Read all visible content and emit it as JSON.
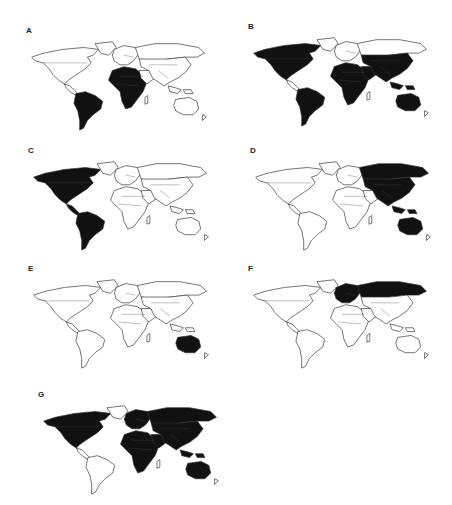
{
  "figure": {
    "type": "panel-of-world-maps",
    "panels": [
      {
        "label": "A",
        "shaded_regions": [
          "south_america_north",
          "central_africa"
        ]
      },
      {
        "label": "B",
        "shaded_regions": [
          "north_america_us_mexico",
          "south_america",
          "west_africa_patches",
          "east_africa_horn",
          "arabia",
          "south_asia_china",
          "southeast_asia",
          "australia"
        ]
      },
      {
        "label": "C",
        "shaded_regions": [
          "north_america",
          "central_america",
          "south_america"
        ]
      },
      {
        "label": "D",
        "shaded_regions": [
          "russia_asia",
          "china",
          "southeast_asia",
          "australia"
        ]
      },
      {
        "label": "E",
        "shaded_regions": [
          "australia"
        ]
      },
      {
        "label": "F",
        "shaded_regions": [
          "europe_russia"
        ]
      },
      {
        "label": "G",
        "shaded_regions": [
          "north_america_us_canada",
          "north_africa",
          "africa_subsaharan",
          "europe_russia",
          "south_asia",
          "southeast_asia",
          "australia"
        ]
      }
    ]
  },
  "colors": {
    "shade": "#111111",
    "outline": "#333333",
    "background": "#ffffff"
  }
}
